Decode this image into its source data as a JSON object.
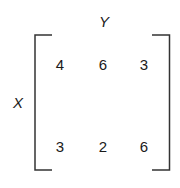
{
  "matrix": {
    "row_label": "X",
    "col_label": "Y",
    "rows": [
      [
        "4",
        "6",
        "3"
      ],
      [
        "3",
        "2",
        "6"
      ]
    ]
  },
  "colors": {
    "ink": "#1a1a1a",
    "background": "#ffffff"
  }
}
